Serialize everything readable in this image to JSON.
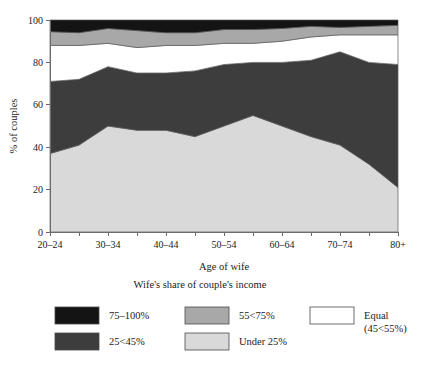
{
  "chart_data": {
    "type": "area",
    "title": "",
    "xlabel": "Age of wife",
    "ylabel": "% of couples",
    "ylim": [
      0,
      100
    ],
    "yticks": [
      0,
      20,
      40,
      60,
      80,
      100
    ],
    "grid": false,
    "stacked": true,
    "stack_order": "bottom-to-top",
    "legend_position": "below",
    "legend_title": "Wife's share of couple's income",
    "categories": [
      "20–24",
      "25–29",
      "30–34",
      "35–39",
      "40–44",
      "45–49",
      "50–54",
      "55–59",
      "60–64",
      "65–69",
      "70–74",
      "75–79",
      "80+"
    ],
    "tick_labels": [
      "20–24",
      "",
      "30–34",
      "",
      "40–44",
      "",
      "50–54",
      "",
      "60–64",
      "",
      "70–74",
      "",
      "80+"
    ],
    "series": [
      {
        "name": "Under 25%",
        "color": "#d9d9d9",
        "values": [
          37,
          41,
          50,
          48,
          48,
          45,
          50,
          55,
          50,
          45,
          41,
          32,
          21
        ]
      },
      {
        "name": "25<45%",
        "color": "#3d3d3d",
        "values": [
          34,
          31,
          28,
          27,
          27,
          31,
          29,
          25,
          30,
          36,
          44,
          48,
          58
        ]
      },
      {
        "name": "Equal (45<55%)",
        "color": "#ffffff",
        "values": [
          17,
          16,
          11,
          12,
          13,
          12,
          10,
          9,
          10,
          11,
          8,
          13,
          14
        ]
      },
      {
        "name": "55<75%",
        "color": "#a8a8a8",
        "values": [
          6.5,
          6,
          7,
          8,
          6,
          6,
          6.5,
          6.5,
          6,
          5,
          3.5,
          4,
          4.5
        ]
      },
      {
        "name": "75–100%",
        "color": "#141414",
        "values": [
          5.5,
          6,
          4,
          5,
          6,
          6,
          4.5,
          4.5,
          4,
          3,
          3.5,
          3,
          2.5
        ]
      }
    ]
  },
  "legend": {
    "title": "Wife's share of couple's income",
    "entries": [
      {
        "label": "75–100%",
        "label2": "",
        "color": "#141414",
        "col": 0,
        "row": 0
      },
      {
        "label": "25<45%",
        "label2": "",
        "color": "#3d3d3d",
        "col": 0,
        "row": 1
      },
      {
        "label": "55<75%",
        "label2": "",
        "color": "#a8a8a8",
        "col": 1,
        "row": 0
      },
      {
        "label": "Under 25%",
        "label2": "",
        "color": "#d9d9d9",
        "col": 1,
        "row": 1
      },
      {
        "label": "Equal",
        "label2": "(45<55%)",
        "color": "#ffffff",
        "col": 2,
        "row": 0
      }
    ]
  },
  "axes": {
    "y_title": "% of couples",
    "x_title": "Age of wife"
  },
  "colors": {
    "axis": "#6b6b6b",
    "text": "#1a1a1a",
    "background": "#ffffff",
    "band_outline": "#5a5a5a"
  }
}
